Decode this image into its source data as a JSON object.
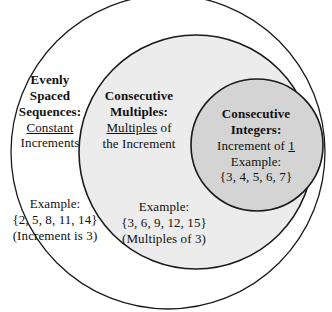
{
  "diagram": {
    "kind": "nested-euler-diagram",
    "background_color": "#ffffff",
    "stroke_color": "#1a1a1a",
    "sets": [
      {
        "id": "evenly-spaced-sequences",
        "name": "Evenly Spaced Sequences",
        "fill_color": "#ffffff",
        "title_lines": [
          "Evenly",
          "Spaced",
          "Sequences:"
        ],
        "definition_lead": "Constant",
        "definition_rest": "Increments",
        "example_label": "Example:",
        "example_set": "{2, 5, 8, 11, 14}",
        "example_note": "(Increment is 3)"
      },
      {
        "id": "consecutive-multiples",
        "name": "Consecutive Multiples",
        "fill_color": "#ececec",
        "title_lines": [
          "Consecutive",
          "Multiples:"
        ],
        "definition_lead": "Multiples",
        "definition_rest": "of",
        "definition_line2": "the Increment",
        "example_label": "Example:",
        "example_set": "{3, 6, 9, 12, 15}",
        "example_note": "(Multiples of 3)"
      },
      {
        "id": "consecutive-integers",
        "name": "Consecutive Integers",
        "fill_color": "#d4d4d4",
        "title_lines": [
          "Consecutive",
          "Integers:"
        ],
        "definition_lead": "Increment of",
        "definition_value": "1",
        "example_label": "Example:",
        "example_set": "{3, 4, 5, 6, 7}"
      }
    ]
  }
}
